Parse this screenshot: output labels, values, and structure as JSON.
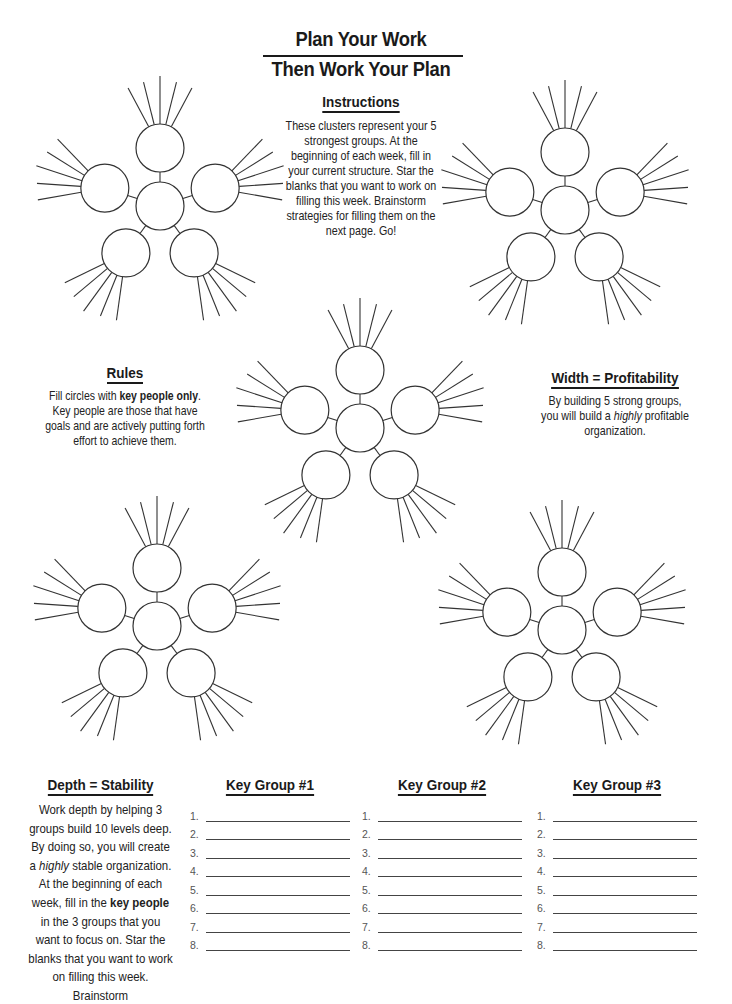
{
  "header": {
    "title_line1": "Plan Your Work",
    "title_line2": "Then Work Your Plan"
  },
  "instructions": {
    "heading": "Instructions",
    "text": "These clusters represent your 5 strongest groups. At the beginning of each week, fill in your current structure. Star the blanks that you want to work on filling this week. Brainstorm strategies for filling them on the next page. Go!"
  },
  "rules": {
    "heading": "Rules",
    "text_before": "Fill circles with ",
    "text_bold": "key people only",
    "text_after": ". Key people are those that have goals and are actively putting forth effort to achieve them."
  },
  "width_section": {
    "heading": "Width = Profitability",
    "text_before": "By building 5 strong groups, you will build a ",
    "text_italic": "highly",
    "text_after": " profitable organization."
  },
  "depth_section": {
    "heading": "Depth = Stability",
    "text_part1": "Work depth by helping 3 groups build 10 levels deep. By doing so, you will create a ",
    "text_italic": "highly",
    "text_part2": " stable organization. At the beginning of each week, fill in the ",
    "text_bold": "key people",
    "text_part3": " in the 3 groups that you want to focus on. Star the blanks that you want to work on filling this week. Brainstorm"
  },
  "key_groups": [
    {
      "heading": "Key Group #1",
      "numbers": [
        "1.",
        "2.",
        "3.",
        "4.",
        "5.",
        "6.",
        "7.",
        "8."
      ]
    },
    {
      "heading": "Key Group #2",
      "numbers": [
        "1.",
        "2.",
        "3.",
        "4.",
        "5.",
        "6.",
        "7.",
        "8."
      ]
    },
    {
      "heading": "Key Group #3",
      "numbers": [
        "1.",
        "2.",
        "3.",
        "4.",
        "5.",
        "6.",
        "7.",
        "8."
      ]
    }
  ],
  "clusters": [
    {
      "name": "cluster-top-left",
      "cx": 160,
      "cy": 206
    },
    {
      "name": "cluster-top-right",
      "cx": 565,
      "cy": 210
    },
    {
      "name": "cluster-center",
      "cx": 360,
      "cy": 428
    },
    {
      "name": "cluster-bottom-left",
      "cx": 157,
      "cy": 626
    },
    {
      "name": "cluster-bottom-right",
      "cx": 562,
      "cy": 630
    }
  ],
  "colors": {
    "ink": "#1a1a1a",
    "stroke": "#333333",
    "paper": "#ffffff"
  }
}
